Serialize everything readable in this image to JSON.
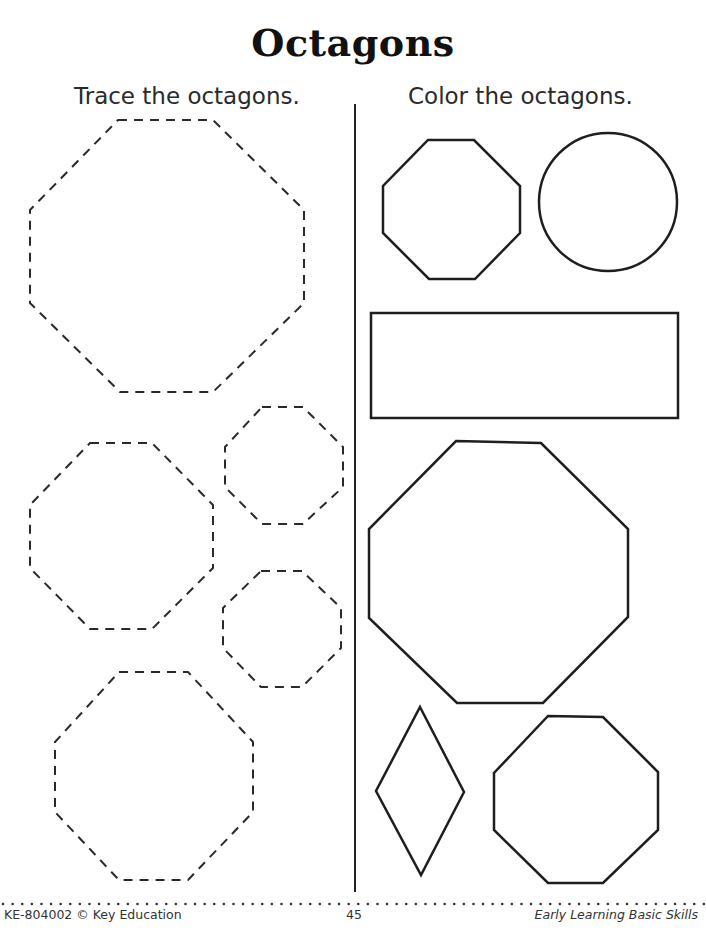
{
  "page": {
    "title": "Octagons",
    "left_instruction": "Trace the octagons.",
    "right_instruction": "Color the octagons."
  },
  "trace_shapes": [
    {
      "type": "octagon",
      "style": "dashed",
      "size": "large",
      "position": "top"
    },
    {
      "type": "octagon",
      "style": "dashed",
      "size": "medium",
      "position": "middle-left"
    },
    {
      "type": "octagon",
      "style": "dashed",
      "size": "small",
      "position": "middle-right-upper"
    },
    {
      "type": "octagon",
      "style": "dashed",
      "size": "small",
      "position": "middle-right-lower"
    },
    {
      "type": "octagon",
      "style": "dashed",
      "size": "large",
      "position": "bottom"
    }
  ],
  "color_shapes": [
    {
      "type": "octagon",
      "style": "solid",
      "position": "top-left"
    },
    {
      "type": "circle",
      "style": "solid",
      "position": "top-right"
    },
    {
      "type": "rectangle",
      "style": "solid",
      "position": "middle"
    },
    {
      "type": "octagon",
      "style": "solid",
      "size": "large",
      "position": "center"
    },
    {
      "type": "diamond",
      "style": "solid",
      "position": "bottom-left"
    },
    {
      "type": "octagon",
      "style": "solid",
      "position": "bottom-right"
    }
  ],
  "footer": {
    "left": "KE-804002 © Key Education",
    "page_number": "45",
    "right": "Early Learning Basic Skills"
  }
}
